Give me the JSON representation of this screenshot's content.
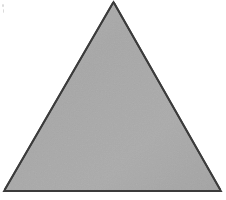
{
  "figure": {
    "type": "polygon-diagram",
    "shape_name": "triangle",
    "canvas": {
      "width": 226,
      "height": 200,
      "background_color": "#ffffff"
    },
    "shapes": [
      {
        "name": "triangle",
        "kind": "polygon",
        "sides": 3,
        "vertices": [
          {
            "label": "apex",
            "x": 113.5,
            "y": 2
          },
          {
            "label": "bottom-right",
            "x": 221,
            "y": 191
          },
          {
            "label": "bottom-left",
            "x": 4,
            "y": 191
          }
        ],
        "points_attr": "113.5,2 221,191 4,191",
        "fill_color": "#a9a9a9",
        "stroke_color": "#3b3b3b",
        "stroke_width": 2,
        "base_width_px": 217,
        "height_px": 189
      }
    ],
    "texture": {
      "name": "scan-grain",
      "enabled": true,
      "opacity": 0.05,
      "light_color": "#b8b8b8",
      "dark_color": "#9c9c9c"
    },
    "artifacts": [
      {
        "name": "speck-a",
        "x": 2,
        "y": 4,
        "color": "#d9d9d9"
      },
      {
        "name": "speck-b",
        "x": 3,
        "y": 9,
        "color": "#d9d9d9"
      }
    ],
    "labels": [],
    "annotations": []
  }
}
